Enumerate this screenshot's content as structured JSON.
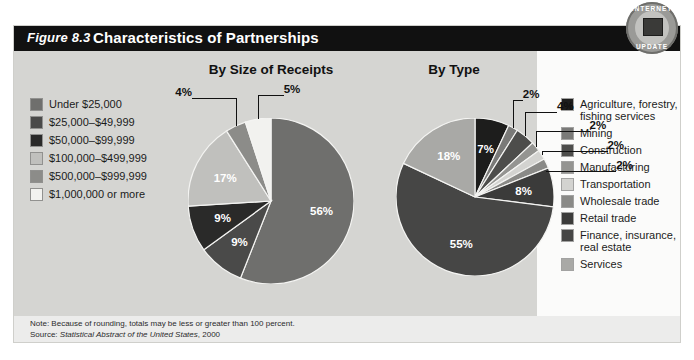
{
  "figure": {
    "label": "Figure 8.3",
    "title": "Characteristics of Partnerships"
  },
  "badge": {
    "top_text": "INTERNET",
    "bottom_text": "UPDATE",
    "icon": "monitor-icon"
  },
  "legend_left": {
    "items": [
      {
        "label": "Under $25,000",
        "color": "#6f6f6d"
      },
      {
        "label": "$25,000–$49,999",
        "color": "#4a4a49"
      },
      {
        "label": "$50,000–$99,999",
        "color": "#2a2a29"
      },
      {
        "label": "$100,000–$499,999",
        "color": "#c0c0bd"
      },
      {
        "label": "$500,000–$999,999",
        "color": "#8c8c89"
      },
      {
        "label": "$1,000,000 or more",
        "color": "#f2f2ef"
      }
    ]
  },
  "legend_right": {
    "items": [
      {
        "label": "Agriculture, forestry,\nfishing services",
        "color": "#1d1d1c"
      },
      {
        "label": "Mining",
        "color": "#7a7a78"
      },
      {
        "label": "Construction",
        "color": "#4d4d4b"
      },
      {
        "label": "Manufacturing",
        "color": "#949491"
      },
      {
        "label": "Transportation",
        "color": "#d3d3d0"
      },
      {
        "label": "Wholesale trade",
        "color": "#8a8a87"
      },
      {
        "label": "Retail trade",
        "color": "#3b3b3a"
      },
      {
        "label": "Finance, insurance,\nreal estate",
        "color": "#464645"
      },
      {
        "label": "Services",
        "color": "#a9a9a6"
      }
    ]
  },
  "footnote": {
    "note_prefix": "Note: ",
    "note_text": "Because of rounding, totals may be less or greater than 100 percent.",
    "source_prefix": "Source: ",
    "source_italic": "Statistical Abstract of the United States",
    "source_year": ", 2000"
  },
  "chart_data": [
    {
      "type": "pie",
      "title": "By Size of Receipts",
      "categories": [
        "Under $25,000",
        "$25,000–$49,999",
        "$50,000–$99,999",
        "$100,000–$499,999",
        "$500,000–$999,999",
        "$1,000,000 or more"
      ],
      "values": [
        56,
        9,
        9,
        17,
        4,
        5
      ],
      "labels": [
        "56%",
        "9%",
        "9%",
        "17%",
        "4%",
        "5%"
      ],
      "colors": [
        "#6f6f6d",
        "#4a4a49",
        "#2a2a29",
        "#c0c0bd",
        "#8c8c89",
        "#f2f2ef"
      ],
      "label_position": [
        "inside",
        "inside",
        "inside",
        "inside",
        "outside",
        "outside"
      ],
      "units": "percent",
      "legend": "legend_left"
    },
    {
      "type": "pie",
      "title": "By Type",
      "categories": [
        "Agriculture, forestry, fishing services",
        "Mining",
        "Construction",
        "Manufacturing",
        "Transportation",
        "Wholesale trade",
        "Retail trade",
        "Finance, insurance, real estate",
        "Services"
      ],
      "values": [
        7,
        2,
        4,
        2,
        2,
        2,
        8,
        55,
        18
      ],
      "labels": [
        "7%",
        "2%",
        "4%",
        "2%",
        "2%",
        "2%",
        "8%",
        "55%",
        "18%"
      ],
      "colors": [
        "#1d1d1c",
        "#7a7a78",
        "#4d4d4b",
        "#949491",
        "#d3d3d0",
        "#8a8a87",
        "#3b3b3a",
        "#464645",
        "#a9a9a6"
      ],
      "label_position": [
        "inside",
        "outside",
        "outside",
        "outside",
        "outside",
        "outside",
        "inside",
        "inside",
        "inside"
      ],
      "units": "percent",
      "legend": "legend_right"
    }
  ]
}
